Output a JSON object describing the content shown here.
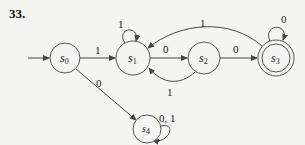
{
  "problem_number": "33.",
  "states": [
    {
      "id": "s0",
      "name": "s",
      "sub": "0",
      "cx": 65,
      "cy": 58,
      "r": 15,
      "accepting": false,
      "start": true
    },
    {
      "id": "s1",
      "name": "s",
      "sub": "1",
      "cx": 133,
      "cy": 58,
      "r": 17,
      "accepting": false,
      "start": false
    },
    {
      "id": "s2",
      "name": "s",
      "sub": "2",
      "cx": 204,
      "cy": 58,
      "r": 16,
      "accepting": false,
      "start": false
    },
    {
      "id": "s3",
      "name": "s",
      "sub": "3",
      "cx": 276,
      "cy": 58,
      "r": 18,
      "accepting": true,
      "start": false
    },
    {
      "id": "s4",
      "name": "s",
      "sub": "4",
      "cx": 147,
      "cy": 129,
      "r": 14,
      "accepting": false,
      "start": false
    }
  ],
  "transitions": [
    {
      "from": "s0",
      "to": "s1",
      "label": "1"
    },
    {
      "from": "s0",
      "to": "s4",
      "label": "0"
    },
    {
      "from": "s1",
      "to": "s1",
      "label": "1"
    },
    {
      "from": "s1",
      "to": "s2",
      "label": "0"
    },
    {
      "from": "s2",
      "to": "s1",
      "label": "1"
    },
    {
      "from": "s2",
      "to": "s3",
      "label": "0"
    },
    {
      "from": "s3",
      "to": "s1",
      "label": "1"
    },
    {
      "from": "s3",
      "to": "s3",
      "label": "0"
    },
    {
      "from": "s4",
      "to": "s4",
      "label": "0, 1"
    }
  ],
  "colors": {
    "line": "#444444",
    "background": "#f4f4f2"
  }
}
